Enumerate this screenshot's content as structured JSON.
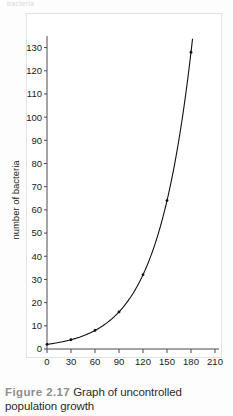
{
  "top_cut_text": "bacteria",
  "caption": {
    "label": "Figure 2.17",
    "text": "Graph of uncontrolled population growth"
  },
  "colors": {
    "curve": "#111111",
    "axis": "#4a4a4a",
    "frame": "#e2e2e2",
    "caption_label": "#8e8e8e",
    "text": "#1a1a1a"
  },
  "chart_data": {
    "type": "line",
    "title": "",
    "xlabel": "time (in minutes)",
    "ylabel": "number of bacteria",
    "xlim": [
      0,
      215
    ],
    "ylim": [
      0,
      135
    ],
    "xticks": [
      0,
      30,
      60,
      90,
      120,
      150,
      180,
      210
    ],
    "yticks": [
      0,
      10,
      20,
      30,
      40,
      50,
      60,
      70,
      80,
      90,
      100,
      110,
      120,
      130
    ],
    "xtick_labels": [
      "0",
      "30",
      "60",
      "90",
      "120",
      "150",
      "180",
      "210"
    ],
    "ytick_labels": [
      "0",
      "10",
      "20",
      "30",
      "40",
      "50",
      "60",
      "70",
      "80",
      "90",
      "100",
      "110",
      "120",
      "130"
    ],
    "grid": false,
    "legend": false,
    "markers": true,
    "series": [
      {
        "name": "bacteria population",
        "x": [
          0,
          30,
          60,
          90,
          120,
          150,
          180,
          210
        ],
        "values": [
          2,
          4,
          8,
          16,
          32,
          64,
          128,
          256
        ]
      }
    ],
    "x": [
      0,
      30,
      60,
      90,
      120,
      150,
      180,
      210
    ],
    "values": [
      2,
      4,
      8,
      16,
      32,
      64,
      128,
      256
    ],
    "annotations": []
  }
}
